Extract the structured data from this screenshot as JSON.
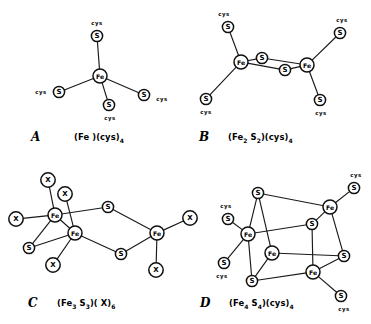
{
  "figure": {
    "background_color": "#ffffff",
    "line_color": "#1a1a1a",
    "node_fill": "#ffffff",
    "width": 371,
    "height": 324
  },
  "atom_labels": {
    "iron": "Fe",
    "sulfur": "S",
    "unknown_ligand": "X",
    "cysteine": "cys"
  },
  "panels": [
    {
      "id": "A",
      "letter": "A",
      "letter_pos": [
        31,
        137
      ],
      "formula_pos": [
        74,
        137
      ],
      "formula_parts": [
        {
          "t": "(Fe )(cys)",
          "sub": false
        },
        {
          "t": "4",
          "sub": true
        }
      ],
      "formula_text": "(Fe )(cys)4",
      "description": "Mononuclear iron center with four cysteine thiolate ligands",
      "nodes": [
        {
          "name": "fe-center",
          "label": "Fe",
          "kind": "fe",
          "x": 100,
          "y": 76,
          "r": 7.0
        },
        {
          "name": "s-top",
          "label": "S",
          "kind": "s",
          "x": 97,
          "y": 36,
          "r": 5.6
        },
        {
          "name": "s-left",
          "label": "S",
          "kind": "s",
          "x": 59,
          "y": 92,
          "r": 5.6
        },
        {
          "name": "s-bottom",
          "label": "S",
          "kind": "s",
          "x": 109,
          "y": 105,
          "r": 5.6
        },
        {
          "name": "s-right",
          "label": "S",
          "kind": "s",
          "x": 144,
          "y": 95,
          "r": 5.6
        }
      ],
      "bonds": [
        [
          "fe-center",
          "s-top"
        ],
        [
          "fe-center",
          "s-left"
        ],
        [
          "fe-center",
          "s-bottom"
        ],
        [
          "fe-center",
          "s-right"
        ]
      ],
      "cys": [
        {
          "name": "cys-top",
          "text": "cys",
          "x": 97,
          "y": 23
        },
        {
          "name": "cys-left",
          "text": "cys",
          "x": 41,
          "y": 92
        },
        {
          "name": "cys-bottom",
          "text": "cys",
          "x": 110,
          "y": 118
        },
        {
          "name": "cys-right",
          "text": "cys",
          "x": 162,
          "y": 99
        }
      ]
    },
    {
      "id": "B",
      "letter": "B",
      "letter_pos": [
        199,
        137
      ],
      "formula_pos": [
        228,
        137
      ],
      "formula_parts": [
        {
          "t": "(Fe",
          "sub": false
        },
        {
          "t": "2",
          "sub": true
        },
        {
          "t": " S",
          "sub": false
        },
        {
          "t": "2",
          "sub": true
        },
        {
          "t": ")(cys)",
          "sub": false
        },
        {
          "t": "4",
          "sub": true
        }
      ],
      "formula_text": "(Fe2 S2)(cys)4",
      "description": "Binuclear two-iron two-sulfur cluster with four cysteine ligands",
      "nodes": [
        {
          "name": "fe-left",
          "label": "Fe",
          "kind": "fe",
          "x": 241,
          "y": 62,
          "r": 7.0
        },
        {
          "name": "fe-right",
          "label": "Fe",
          "kind": "fe",
          "x": 307,
          "y": 65,
          "r": 7.0
        },
        {
          "name": "s-bridge-top",
          "label": "S",
          "kind": "s",
          "x": 262,
          "y": 58,
          "r": 5.6
        },
        {
          "name": "s-bridge-bottom",
          "label": "S",
          "kind": "s",
          "x": 285,
          "y": 70,
          "r": 5.6
        },
        {
          "name": "s-upper-left",
          "label": "S",
          "kind": "s",
          "x": 228,
          "y": 27,
          "r": 5.6
        },
        {
          "name": "s-lower-left",
          "label": "S",
          "kind": "s",
          "x": 206,
          "y": 99,
          "r": 5.6
        },
        {
          "name": "s-upper-right",
          "label": "S",
          "kind": "s",
          "x": 340,
          "y": 33,
          "r": 5.6
        },
        {
          "name": "s-lower-right",
          "label": "S",
          "kind": "s",
          "x": 320,
          "y": 100,
          "r": 5.6
        }
      ],
      "bonds": [
        [
          "fe-left",
          "s-bridge-top"
        ],
        [
          "fe-left",
          "s-bridge-bottom"
        ],
        [
          "fe-right",
          "s-bridge-top"
        ],
        [
          "fe-right",
          "s-bridge-bottom"
        ],
        [
          "fe-left",
          "s-upper-left"
        ],
        [
          "fe-left",
          "s-lower-left"
        ],
        [
          "fe-right",
          "s-upper-right"
        ],
        [
          "fe-right",
          "s-lower-right"
        ]
      ],
      "cys": [
        {
          "name": "cys-upper-left",
          "text": "cys",
          "x": 224,
          "y": 14
        },
        {
          "name": "cys-lower-left",
          "text": "cys",
          "x": 206,
          "y": 112
        },
        {
          "name": "cys-upper-right",
          "text": "cys",
          "x": 342,
          "y": 20
        },
        {
          "name": "cys-lower-right",
          "text": "cys",
          "x": 321,
          "y": 113
        }
      ]
    },
    {
      "id": "C",
      "letter": "C",
      "letter_pos": [
        28,
        303
      ],
      "formula_pos": [
        57,
        303
      ],
      "formula_parts": [
        {
          "t": "(Fe",
          "sub": false
        },
        {
          "t": "3",
          "sub": true
        },
        {
          "t": " S",
          "sub": false
        },
        {
          "t": "3",
          "sub": true
        },
        {
          "t": ")( X)",
          "sub": false
        },
        {
          "t": "6",
          "sub": true
        }
      ],
      "formula_text": "(Fe3 S3)( X)6",
      "description": "Trinuclear three-iron three-sulfur ring cluster with six X ligands",
      "nodes": [
        {
          "name": "fe-upper-left",
          "label": "Fe",
          "kind": "fe",
          "x": 55,
          "y": 215,
          "r": 7.0
        },
        {
          "name": "fe-lower-left",
          "label": "Fe",
          "kind": "fe",
          "x": 75,
          "y": 233,
          "r": 7.0
        },
        {
          "name": "fe-right",
          "label": "Fe",
          "kind": "fe",
          "x": 157,
          "y": 233,
          "r": 7.0
        },
        {
          "name": "s-top-bridge",
          "label": "S",
          "kind": "s",
          "x": 108,
          "y": 207,
          "r": 5.6
        },
        {
          "name": "s-bottom-bridge",
          "label": "S",
          "kind": "s",
          "x": 121,
          "y": 254,
          "r": 5.6
        },
        {
          "name": "s-left-low",
          "label": "S",
          "kind": "s",
          "x": 29,
          "y": 248,
          "r": 5.6
        },
        {
          "name": "x-top-a",
          "label": "X",
          "kind": "x",
          "x": 48,
          "y": 180,
          "r": 7.2
        },
        {
          "name": "x-top-b",
          "label": "X",
          "kind": "x",
          "x": 65,
          "y": 194,
          "r": 7.2
        },
        {
          "name": "x-far-left",
          "label": "X",
          "kind": "x",
          "x": 16,
          "y": 219,
          "r": 7.2
        },
        {
          "name": "x-bottom-left",
          "label": "X",
          "kind": "x",
          "x": 53,
          "y": 265,
          "r": 7.2
        },
        {
          "name": "x-right-upper",
          "label": "X",
          "kind": "x",
          "x": 190,
          "y": 218,
          "r": 7.2
        },
        {
          "name": "x-right-lower",
          "label": "X",
          "kind": "x",
          "x": 156,
          "y": 270,
          "r": 7.2
        }
      ],
      "bonds": [
        [
          "fe-upper-left",
          "fe-lower-left"
        ],
        [
          "fe-upper-left",
          "x-top-a"
        ],
        [
          "fe-upper-left",
          "x-far-left"
        ],
        [
          "fe-upper-left",
          "s-left-low"
        ],
        [
          "fe-upper-left",
          "s-top-bridge"
        ],
        [
          "fe-lower-left",
          "x-top-b"
        ],
        [
          "fe-lower-left",
          "s-left-low"
        ],
        [
          "fe-lower-left",
          "x-bottom-left"
        ],
        [
          "fe-lower-left",
          "s-bottom-bridge"
        ],
        [
          "s-top-bridge",
          "fe-right"
        ],
        [
          "s-bottom-bridge",
          "fe-right"
        ],
        [
          "fe-right",
          "x-right-upper"
        ],
        [
          "fe-right",
          "x-right-lower"
        ]
      ],
      "cys": []
    },
    {
      "id": "D",
      "letter": "D",
      "letter_pos": [
        200,
        303
      ],
      "formula_pos": [
        229,
        303
      ],
      "formula_parts": [
        {
          "t": "(Fe",
          "sub": false
        },
        {
          "t": "4",
          "sub": true
        },
        {
          "t": " S",
          "sub": false
        },
        {
          "t": "4",
          "sub": true
        },
        {
          "t": ")(cys)",
          "sub": false
        },
        {
          "t": "4",
          "sub": true
        }
      ],
      "formula_text": "(Fe4 S4)(cys)4",
      "description": "Cubane four-iron four-sulfur cluster with four cysteine ligands",
      "nodes": [
        {
          "name": "fe-left",
          "label": "Fe",
          "kind": "fe",
          "x": 248,
          "y": 234,
          "r": 7.0
        },
        {
          "name": "fe-top-right",
          "label": "Fe",
          "kind": "fe",
          "x": 330,
          "y": 207,
          "r": 7.0
        },
        {
          "name": "fe-center",
          "label": "Fe",
          "kind": "fe",
          "x": 272,
          "y": 253,
          "r": 7.0
        },
        {
          "name": "fe-bottom-right",
          "label": "Fe",
          "kind": "fe",
          "x": 313,
          "y": 272,
          "r": 7.0
        },
        {
          "name": "s-top",
          "label": "S",
          "kind": "s",
          "x": 258,
          "y": 193,
          "r": 5.6
        },
        {
          "name": "s-mid",
          "label": "S",
          "kind": "s",
          "x": 312,
          "y": 224,
          "r": 5.6
        },
        {
          "name": "s-bottom",
          "label": "S",
          "kind": "s",
          "x": 252,
          "y": 281,
          "r": 5.6
        },
        {
          "name": "s-right",
          "label": "S",
          "kind": "s",
          "x": 344,
          "y": 256,
          "r": 5.6
        },
        {
          "name": "s-cys-upper-left",
          "label": "S",
          "kind": "s",
          "x": 228,
          "y": 219,
          "r": 5.6
        },
        {
          "name": "s-cys-lower-left",
          "label": "S",
          "kind": "s",
          "x": 224,
          "y": 263,
          "r": 5.6
        },
        {
          "name": "s-cys-upper-right",
          "label": "S",
          "kind": "s",
          "x": 354,
          "y": 188,
          "r": 5.6
        },
        {
          "name": "s-cys-lower-right",
          "label": "S",
          "kind": "s",
          "x": 341,
          "y": 296,
          "r": 5.6
        }
      ],
      "bonds": [
        [
          "s-top",
          "fe-left"
        ],
        [
          "s-top",
          "fe-center"
        ],
        [
          "s-top",
          "fe-top-right"
        ],
        [
          "s-mid",
          "fe-top-right"
        ],
        [
          "s-mid",
          "fe-left"
        ],
        [
          "s-mid",
          "fe-bottom-right"
        ],
        [
          "s-bottom",
          "fe-left"
        ],
        [
          "s-bottom",
          "fe-center"
        ],
        [
          "s-bottom",
          "fe-bottom-right"
        ],
        [
          "s-right",
          "fe-top-right"
        ],
        [
          "s-right",
          "fe-center"
        ],
        [
          "s-right",
          "fe-bottom-right"
        ],
        [
          "fe-left",
          "s-cys-upper-left"
        ],
        [
          "fe-left",
          "s-cys-lower-left"
        ],
        [
          "fe-top-right",
          "s-cys-upper-right"
        ],
        [
          "fe-bottom-right",
          "s-cys-lower-right"
        ]
      ],
      "cys": [
        {
          "name": "cys-upper-left",
          "text": "cys",
          "x": 226,
          "y": 206
        },
        {
          "name": "cys-lower-left",
          "text": "cys",
          "x": 222,
          "y": 276
        },
        {
          "name": "cys-upper-right",
          "text": "cys",
          "x": 356,
          "y": 175
        },
        {
          "name": "cys-lower-right",
          "text": "cys",
          "x": 344,
          "y": 309
        }
      ]
    }
  ]
}
